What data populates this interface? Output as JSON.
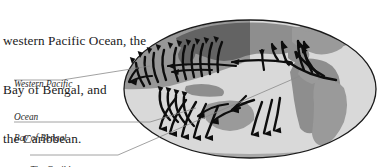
{
  "figure": {
    "kind": "world-map-diagram",
    "projection": "oval",
    "heading_lines": [
      "western Pacific Ocean, the",
      "Bay of Bengal, and",
      "the Caribbean."
    ],
    "labels": [
      {
        "id": "western-pacific-ocean",
        "lines": [
          "Western Pacific",
          "Ocean"
        ],
        "underline": true,
        "leader": "up-right into north-west Pacific"
      },
      {
        "id": "bay-of-bengal",
        "lines": [
          "Bay of Bengal"
        ],
        "underline": true,
        "leader": "right into Indian Ocean"
      },
      {
        "id": "the-caribbean",
        "lines": [
          "The Caribbean"
        ],
        "underline": true,
        "leader": "up-right into western Atlantic"
      }
    ],
    "colors": {
      "ocean_light": "#d9d9d9",
      "ocean_shaded": "#9a9a9a",
      "land_light": "#b0b0b0",
      "land_shaded": "#7d7d7d",
      "outline": "#1a1a1a",
      "arrow": "#0d0d0d",
      "leader": "#7a7a7a",
      "text": "#1a1a1a",
      "background": "#ffffff"
    },
    "arrow_groups": [
      {
        "region": "north-west-pacific",
        "count": 12,
        "hemisphere": "north",
        "curve": "recurve-right-to-left-then-poleward"
      },
      {
        "region": "bay-of-bengal-arabian-sea",
        "count": 4,
        "hemisphere": "north",
        "curve": "westward-then-poleward"
      },
      {
        "region": "north-atlantic-caribbean",
        "count": 9,
        "hemisphere": "north",
        "curve": "westward-then-poleward"
      },
      {
        "region": "south-indian-ocean",
        "count": 8,
        "hemisphere": "south",
        "curve": "westward-then-equatorward-mirror"
      },
      {
        "region": "south-pacific-australia",
        "count": 5,
        "hemisphere": "south",
        "curve": "westward-then-equatorward-mirror"
      }
    ]
  }
}
